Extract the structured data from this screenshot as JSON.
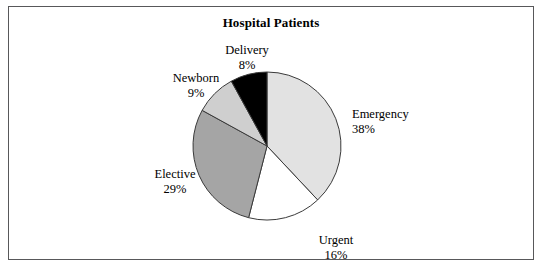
{
  "figure": {
    "title": "Hospital Patients",
    "background": "#ffffff",
    "border_color": "#58585a"
  },
  "labels": {
    "emergency": {
      "name": "Emergency",
      "value": "38%"
    },
    "urgent": {
      "name": "Urgent",
      "value": "16%"
    },
    "elective": {
      "name": "Elective",
      "value": "29%"
    },
    "newborn": {
      "name": "Newborn",
      "value": "9%"
    },
    "delivery": {
      "name": "Delivery",
      "value": "8%"
    }
  },
  "chart_data": {
    "type": "pie",
    "title": "Hospital Patients",
    "xlabel": "",
    "ylabel": "",
    "legend": "none",
    "grid": false,
    "start_angle_deg": 90,
    "direction": "clockwise",
    "categories": [
      "Emergency",
      "Urgent",
      "Elective",
      "Newborn",
      "Delivery"
    ],
    "values": [
      38,
      16,
      29,
      9,
      8
    ],
    "value_labels": [
      "38%",
      "16%",
      "29%",
      "9%",
      "8%"
    ],
    "units": "percent",
    "total": 100,
    "slice_colors": [
      "#e2e2e2",
      "#ffffff",
      "#a5a5a5",
      "#cfcfcf",
      "#000000"
    ],
    "slice_edge_color": "#3a3a3a",
    "label_positions": [
      "right",
      "bottom",
      "left",
      "upper-left",
      "top"
    ],
    "center": {
      "x": 266,
      "y": 145
    },
    "radius": 74
  }
}
